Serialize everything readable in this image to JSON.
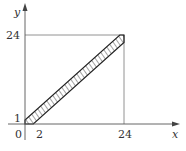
{
  "diagram": {
    "type": "region-plot",
    "axes": {
      "x_label": "x",
      "y_label": "y",
      "origin_label": "0"
    },
    "ticks": {
      "x": [
        {
          "value": 2,
          "label": "2"
        },
        {
          "value": 24,
          "label": "24"
        }
      ],
      "y": [
        {
          "value": 1,
          "label": "1"
        },
        {
          "value": 24,
          "label": "24"
        }
      ]
    },
    "square": {
      "x_min": 0,
      "x_max": 24,
      "y_min": 0,
      "y_max": 24
    },
    "shaded_region": {
      "upper_boundary": "y = x + 1",
      "lower_boundary": "y = x - 2",
      "vertices": [
        [
          0,
          0
        ],
        [
          0,
          1
        ],
        [
          23,
          24
        ],
        [
          24,
          24
        ],
        [
          24,
          22
        ],
        [
          2,
          0
        ]
      ],
      "fill": "hatched"
    },
    "colors": {
      "axis": "#555555",
      "boundary": "#222222",
      "hatch": "#333333",
      "square": "#777777"
    }
  }
}
